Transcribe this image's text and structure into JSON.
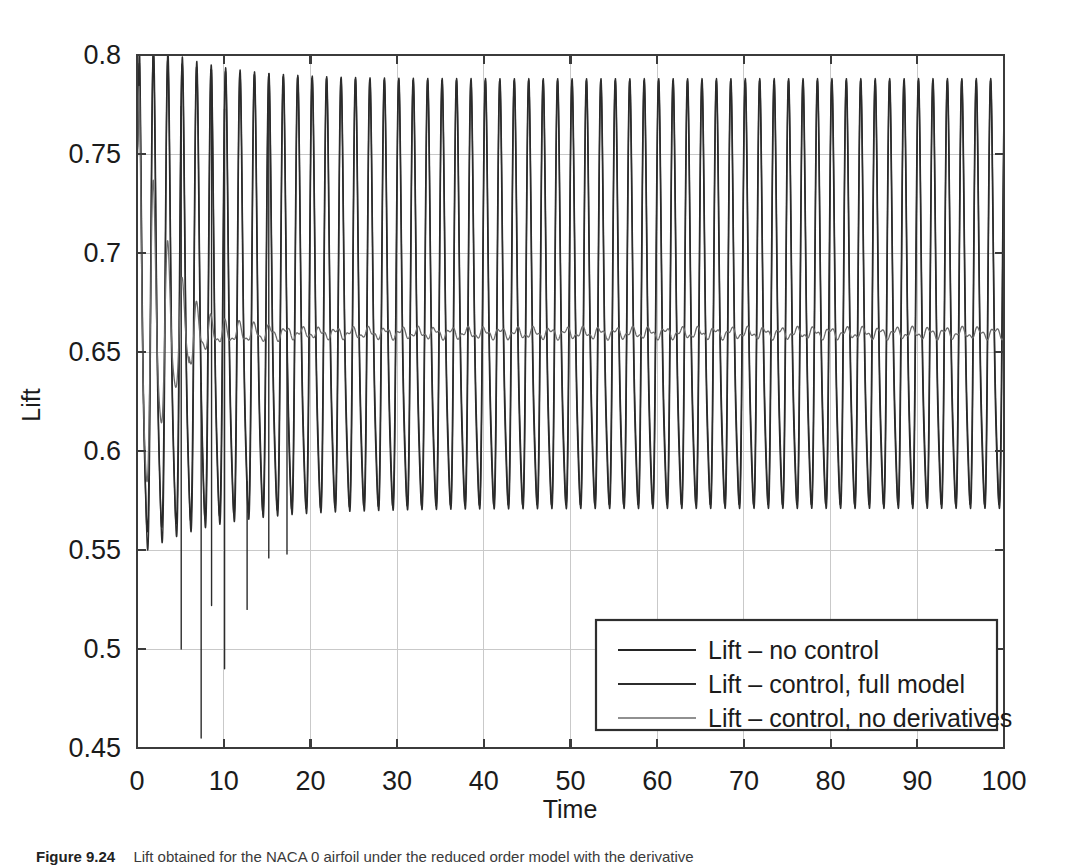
{
  "figure": {
    "caption_prefix": "Figure 9.24",
    "caption_text": "Lift obtained for the NACA 0 airfoil under the reduced order model with the derivative"
  },
  "chart_data": {
    "type": "line",
    "title": "",
    "xlabel": "Time",
    "ylabel": "Lift",
    "xlim": [
      0,
      100
    ],
    "ylim": [
      0.45,
      0.8
    ],
    "xticks": [
      0,
      10,
      20,
      30,
      40,
      50,
      60,
      70,
      80,
      90,
      100
    ],
    "xticklabels": [
      "0",
      "10",
      "20",
      "30",
      "40",
      "50",
      "60",
      "70",
      "80",
      "90",
      "100"
    ],
    "yticks": [
      0.45,
      0.5,
      0.55,
      0.6,
      0.65,
      0.7,
      0.75,
      0.8
    ],
    "yticklabels": [
      "0.45",
      "0.5",
      "0.55",
      "0.6",
      "0.65",
      "0.7",
      "0.75",
      "0.8"
    ],
    "grid": true,
    "legend_position": "lower right",
    "series": [
      {
        "name": "Lift – no control",
        "color": "#242424",
        "width": 1.5,
        "kind": "oscillation",
        "params": {
          "y0": 0.752,
          "mean_start": 0.664,
          "mean_end": 0.666,
          "amp_start": 0.118,
          "amp_end": 0.103,
          "decay_time": 9.0,
          "period": 1.665,
          "phase": 0.62,
          "harmonic2": 0.2,
          "harmonic2_phase": 0.35,
          "spikes": []
        }
      },
      {
        "name": "Lift – control, full model",
        "color": "#2c2c2c",
        "width": 1.4,
        "kind": "oscillation",
        "params": {
          "y0": 0.748,
          "mean_start": 0.662,
          "mean_end": 0.666,
          "amp_start": 0.125,
          "amp_end": 0.103,
          "decay_time": 8.0,
          "period": 1.665,
          "phase": 0.5,
          "harmonic2": 0.22,
          "harmonic2_phase": 0.2,
          "spikes": [
            {
              "t": 5.1,
              "depth": 0.5
            },
            {
              "t": 7.4,
              "depth": 0.455
            },
            {
              "t": 8.6,
              "depth": 0.522
            },
            {
              "t": 10.1,
              "depth": 0.49
            },
            {
              "t": 12.7,
              "depth": 0.52
            },
            {
              "t": 15.2,
              "depth": 0.546
            },
            {
              "t": 17.3,
              "depth": 0.548
            }
          ]
        }
      },
      {
        "name": "Lift – control, no derivatives",
        "color": "#6b6b6b",
        "width": 1.3,
        "kind": "damped",
        "params": {
          "y0": 0.752,
          "settle": 0.6595,
          "amp_start": 0.118,
          "decay_time": 3.3,
          "period": 1.665,
          "phase": 0.62,
          "harmonic2": 0.18,
          "harmonic2_phase": 0.35,
          "ripple_amp": 0.0022,
          "ripple_period": 1.9
        }
      }
    ],
    "steady_state": {
      "oscillation_max": 0.769,
      "oscillation_min": 0.563,
      "controlled_level": 0.6595
    }
  },
  "legend": {
    "entries": [
      {
        "label": "Lift – no control"
      },
      {
        "label": "Lift – control, full model"
      },
      {
        "label": "Lift – control, no derivatives"
      }
    ]
  }
}
